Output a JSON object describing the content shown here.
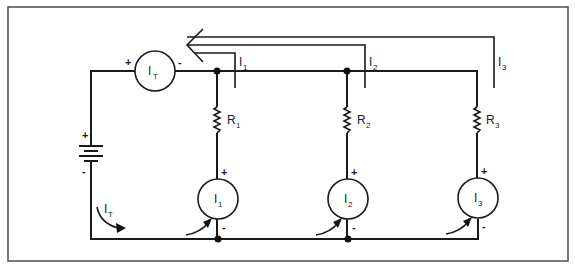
{
  "diagram": {
    "type": "parallel-circuit-current-measurement",
    "colors": {
      "line": "#1a1a1a",
      "frame": "#555555",
      "background": "#ffffff"
    },
    "source": {
      "name": "battery",
      "positive_label": "+",
      "negative_label": "-"
    },
    "total_meter": {
      "label_main": "I",
      "label_sub": "T",
      "positive_label": "+",
      "negative_label": "-"
    },
    "total_current_arrow": {
      "label_main": "I",
      "label_sub": "T"
    },
    "branches": [
      {
        "resistor": {
          "label_main": "R",
          "label_sub": "1"
        },
        "meter": {
          "label_main": "I",
          "label_sub": "1",
          "positive_label": "+",
          "negative_label": "-"
        },
        "current": {
          "label_main": "I",
          "label_sub": "1"
        }
      },
      {
        "resistor": {
          "label_main": "R",
          "label_sub": "2"
        },
        "meter": {
          "label_main": "I",
          "label_sub": "2",
          "positive_label": "+",
          "negative_label": "-"
        },
        "current": {
          "label_main": "I",
          "label_sub": "2"
        }
      },
      {
        "resistor": {
          "label_main": "R",
          "label_sub": "3"
        },
        "meter": {
          "label_main": "I",
          "label_sub": "3",
          "positive_label": "+",
          "negative_label": "-"
        },
        "current": {
          "label_main": "I",
          "label_sub": "3"
        }
      }
    ]
  }
}
